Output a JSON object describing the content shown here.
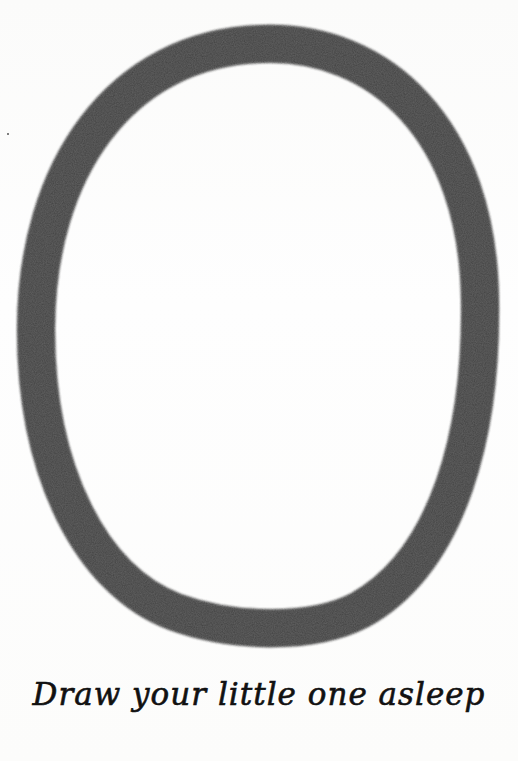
{
  "page": {
    "background": "#fdfdfc",
    "frame": {
      "shape": "oval",
      "stroke_color": "#5e5e5e",
      "center_x": 257,
      "center_y": 334,
      "radius_x": 222,
      "radius_y": 290,
      "stroke_width": 38
    },
    "caption": "Draw your little one asleep",
    "caption_color": "#111111"
  }
}
